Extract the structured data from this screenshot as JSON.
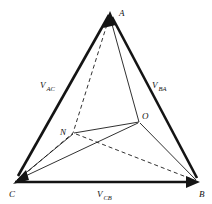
{
  "figure": {
    "type": "vector-triangle-diagram",
    "title": "",
    "background_color": "#ffffff",
    "line_color": "#141414"
  },
  "vertices": [
    {
      "id": "A",
      "label": "A",
      "x": 110,
      "y": 13,
      "label_x": 119,
      "label_y": 14
    },
    {
      "id": "B",
      "label": "B",
      "x": 198,
      "y": 182,
      "label_x": 200,
      "label_y": 195
    },
    {
      "id": "C",
      "label": "C",
      "x": 14,
      "y": 182,
      "label_x": 10,
      "label_y": 195
    },
    {
      "id": "N",
      "label": "N",
      "x": 73,
      "y": 133,
      "label_x": 62,
      "label_y": 132
    },
    {
      "id": "O",
      "label": "O",
      "x": 139,
      "y": 122,
      "label_x": 142,
      "label_y": 118
    }
  ],
  "vector_labels": [
    {
      "id": "V_AC",
      "base": "V",
      "subscript": "AC",
      "x": 40,
      "y": 88,
      "from": "A",
      "to": "C"
    },
    {
      "id": "V_BA",
      "base": "V",
      "subscript": "BA",
      "x": 152,
      "y": 88,
      "from": "B",
      "to": "A"
    },
    {
      "id": "V_CB",
      "base": "V",
      "subscript": "CB",
      "x": 100,
      "y": 196,
      "from": "C",
      "to": "B"
    }
  ],
  "edges": [
    {
      "id": "A-C",
      "from": "A",
      "to": "C",
      "style": "solid-thick",
      "arrow_at": "C"
    },
    {
      "id": "B-A",
      "from": "B",
      "to": "A",
      "style": "solid-thick",
      "arrow_at": "A"
    },
    {
      "id": "C-B",
      "from": "C",
      "to": "B",
      "style": "solid-thick",
      "arrow_at": "B"
    },
    {
      "id": "A-O",
      "from": "A",
      "to": "O",
      "style": "solid-thin",
      "arrow_at": "none"
    },
    {
      "id": "A-N-C",
      "from": "A",
      "to": "C",
      "style": "dashed",
      "arrow_at": "none"
    },
    {
      "id": "N-O",
      "from": "N",
      "to": "O",
      "style": "solid-thin",
      "arrow_at": "none"
    },
    {
      "id": "N-C",
      "from": "N",
      "to": "C",
      "style": "solid-thin",
      "arrow_at": "none"
    },
    {
      "id": "O-C",
      "from": "O",
      "to": "C",
      "style": "solid-thin",
      "arrow_at": "none"
    },
    {
      "id": "O-B",
      "from": "O",
      "to": "B",
      "style": "solid-thin",
      "arrow_at": "none"
    },
    {
      "id": "N-B",
      "from": "N",
      "to": "B",
      "style": "dashed",
      "arrow_at": "none"
    }
  ]
}
